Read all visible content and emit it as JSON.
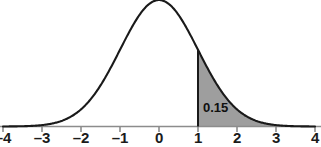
{
  "figure": {
    "type": "normal-distribution-plot",
    "background_color": "#ffffff",
    "curve_color": "#1a1a1a",
    "axis_color": "#8c8c8c",
    "shade_color": "#9e9e9e",
    "label_color": "#1b1b1b"
  },
  "axis": {
    "name": "x-axis",
    "tick_labels": [
      "–4",
      "–3",
      "–2",
      "–1",
      "0",
      "1",
      "2",
      "3",
      "4"
    ],
    "tick_values": [
      -4,
      -3,
      -2,
      -1,
      0,
      1,
      2,
      3,
      4
    ],
    "range": [
      -4,
      4
    ]
  },
  "annotation": {
    "area_label": "0.15"
  },
  "chart_data": {
    "type": "area",
    "title": "",
    "subtitle": "",
    "xlabel": "",
    "ylabel": "",
    "xlim": [
      -4,
      4
    ],
    "ylim": [
      0,
      0.41
    ],
    "grid": false,
    "legend": null,
    "distribution": {
      "name": "standard normal",
      "mean": 0,
      "sd": 1
    },
    "shaded_region": {
      "from": 1,
      "to": 4,
      "label": "0.15",
      "probability": 0.15,
      "fill": "#9e9e9e"
    },
    "x": [
      -4,
      -3.75,
      -3.5,
      -3.25,
      -3,
      -2.75,
      -2.5,
      -2.25,
      -2,
      -1.75,
      -1.5,
      -1.25,
      -1,
      -0.75,
      -0.5,
      -0.25,
      0,
      0.25,
      0.5,
      0.75,
      1,
      1.25,
      1.5,
      1.75,
      2,
      2.25,
      2.5,
      2.75,
      3,
      3.25,
      3.5,
      3.75,
      4
    ],
    "y": [
      0.0001,
      0.0004,
      0.0009,
      0.002,
      0.0044,
      0.0091,
      0.0175,
      0.0317,
      0.054,
      0.0863,
      0.1295,
      0.1826,
      0.242,
      0.3011,
      0.3521,
      0.3867,
      0.3989,
      0.3867,
      0.3521,
      0.3011,
      0.242,
      0.1826,
      0.1295,
      0.0863,
      0.054,
      0.0317,
      0.0175,
      0.0091,
      0.0044,
      0.002,
      0.0009,
      0.0004,
      0.0001
    ],
    "tick_labels": [
      "–4",
      "–3",
      "–2",
      "–1",
      "0",
      "1",
      "2",
      "3",
      "4"
    ],
    "tick_values": [
      -4,
      -3,
      -2,
      -1,
      0,
      1,
      2,
      3,
      4
    ]
  }
}
